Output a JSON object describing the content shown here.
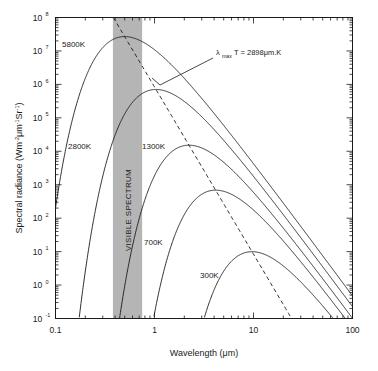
{
  "chart_data": {
    "type": "line",
    "title": "",
    "xlabel": "Wavelength (μm)",
    "ylabel": "Spectral radiance (Wm⁻²μm⁻¹Sr⁻¹)",
    "xscale": "log",
    "yscale": "log",
    "xlim": [
      0.1,
      100
    ],
    "ylim": [
      0.1,
      100000000
    ],
    "xticks": [
      "0.1",
      "1",
      "10",
      "100"
    ],
    "xtick_values": [
      0.1,
      1,
      10,
      100
    ],
    "yticks": [
      "10⁻¹",
      "10⁰",
      "10¹",
      "10²",
      "10³",
      "10⁴",
      "10⁵",
      "10⁶",
      "10⁷",
      "10⁸"
    ],
    "ytick_exponents": [
      "-1",
      "0",
      "1",
      "2",
      "3",
      "4",
      "5",
      "6",
      "7",
      "8"
    ],
    "ytick_values": [
      0.1,
      1,
      10,
      100,
      1000,
      10000,
      100000,
      1000000,
      10000000,
      100000000
    ],
    "grid": false,
    "legend_position": "inline-labels",
    "series": [
      {
        "name": "5800K",
        "temperature_K": 5800,
        "label": "5800K",
        "peak_wavelength_um": 0.4997,
        "peak_radiance": 26000000.0,
        "color": "#1a1a1a",
        "style": "solid"
      },
      {
        "name": "2800K",
        "temperature_K": 2800,
        "label": "2800K",
        "peak_wavelength_um": 1.035,
        "peak_radiance": 830000.0,
        "color": "#1a1a1a",
        "style": "solid"
      },
      {
        "name": "1300K",
        "temperature_K": 1300,
        "label": "1300K",
        "peak_wavelength_um": 2.2292,
        "peak_radiance": 21000.0,
        "color": "#1a1a1a",
        "style": "solid"
      },
      {
        "name": "700K",
        "temperature_K": 700,
        "label": "700K",
        "peak_wavelength_um": 4.14,
        "peak_radiance": 1200.0,
        "color": "#1a1a1a",
        "style": "solid"
      },
      {
        "name": "300K",
        "temperature_K": 300,
        "label": "300K",
        "peak_wavelength_um": 9.66,
        "peak_radiance": 31.0,
        "color": "#1a1a1a",
        "style": "solid"
      }
    ],
    "wien_line": {
      "name": "Wien displacement locus",
      "style": "dashed",
      "color": "#1a1a1a",
      "annotation": "λmaxT = 2898μm.K",
      "annotation_main_pre": "λ",
      "annotation_sub": "max",
      "annotation_main_post": "T = 2898μm.K",
      "constant_um_K": 2898
    },
    "visible_band": {
      "label": "VISIBLE SPECTRUM",
      "start_um": 0.38,
      "end_um": 0.75,
      "fill_color": "#b5b5b5"
    },
    "axes_color": "#1a1a1a",
    "background_color": "#ffffff"
  },
  "axis": {
    "x_label": "Wavelength (μm)",
    "y_label_full": "Spectral radiance (Wm⁻²μm⁻¹Sr⁻¹)",
    "y_label_main": "Spectral radiance (Wm",
    "y_label_sup1": "-2",
    "y_label_mid": "μm",
    "y_label_sup2": "-1",
    "y_label_mid2": "Sr",
    "y_label_sup3": "-1",
    "y_label_end": ")",
    "mantissa": "10"
  }
}
